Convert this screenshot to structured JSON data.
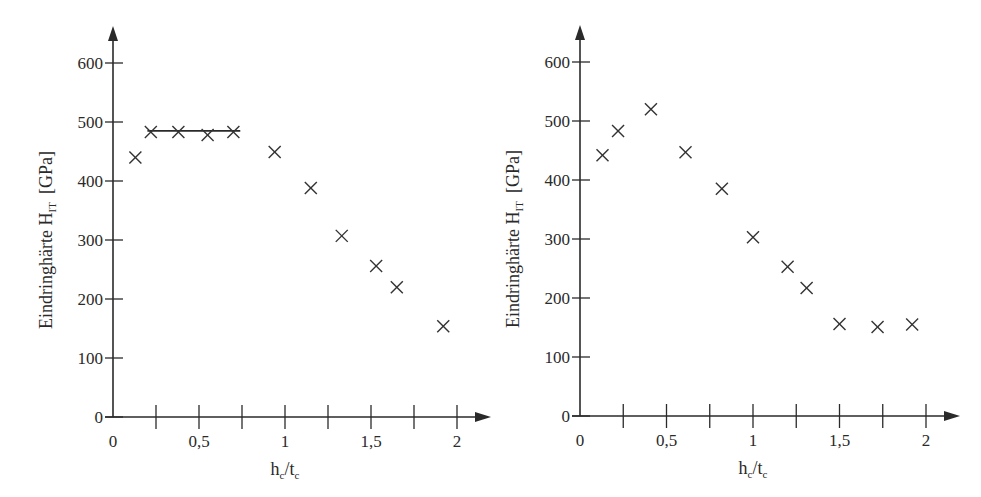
{
  "chart_data": [
    {
      "type": "scatter",
      "title": "",
      "xlabel": "h_c/t_c",
      "ylabel": "Eindringhärte H_IT [GPa]",
      "xlim": [
        0,
        2
      ],
      "ylim": [
        0,
        600
      ],
      "x_ticks": [
        0,
        0.25,
        0.5,
        0.75,
        1,
        1.25,
        1.5,
        1.75,
        2
      ],
      "x_tick_labels": [
        "0",
        "",
        "0,5",
        "",
        "1",
        "",
        "1,5",
        "",
        "2"
      ],
      "y_ticks": [
        0,
        100,
        200,
        300,
        400,
        500,
        600
      ],
      "y_tick_labels": [
        "0",
        "100",
        "200",
        "300",
        "400",
        "500",
        "600"
      ],
      "grid": false,
      "marker": "x",
      "series": [
        {
          "name": "Messwerte",
          "x": [
            0.13,
            0.22,
            0.38,
            0.55,
            0.7,
            0.94,
            1.15,
            1.33,
            1.53,
            1.65,
            1.92
          ],
          "y": [
            440,
            483,
            483,
            478,
            483,
            449,
            388,
            307,
            256,
            220,
            154
          ]
        }
      ],
      "annotations": [
        {
          "type": "horizontal_line",
          "x_from": 0.2,
          "x_to": 0.74,
          "y": 485,
          "label": "plateau"
        }
      ]
    },
    {
      "type": "scatter",
      "title": "",
      "xlabel": "h_c/t_c",
      "ylabel": "Eindringhärte H_IT [GPa]",
      "xlim": [
        0,
        2
      ],
      "ylim": [
        0,
        600
      ],
      "x_ticks": [
        0,
        0.25,
        0.5,
        0.75,
        1,
        1.25,
        1.5,
        1.75,
        2
      ],
      "x_tick_labels": [
        "0",
        "",
        "0,5",
        "",
        "1",
        "",
        "1,5",
        "",
        "2"
      ],
      "y_ticks": [
        0,
        100,
        200,
        300,
        400,
        500,
        600
      ],
      "y_tick_labels": [
        "0",
        "100",
        "200",
        "300",
        "400",
        "500",
        "600"
      ],
      "grid": false,
      "marker": "x",
      "series": [
        {
          "name": "Messwerte",
          "x": [
            0.13,
            0.22,
            0.41,
            0.61,
            0.82,
            1.0,
            1.2,
            1.31,
            1.5,
            1.72,
            1.92
          ],
          "y": [
            442,
            483,
            520,
            447,
            385,
            303,
            253,
            217,
            156,
            151,
            155
          ]
        }
      ]
    }
  ],
  "labels": {
    "ylabel_main": "Eindringhärte H",
    "ylabel_sub": "IT",
    "ylabel_unit": "[GPa]",
    "xlabel_h": "h",
    "xlabel_sub1": "c",
    "xlabel_slash": "/t",
    "xlabel_sub2": "c"
  }
}
